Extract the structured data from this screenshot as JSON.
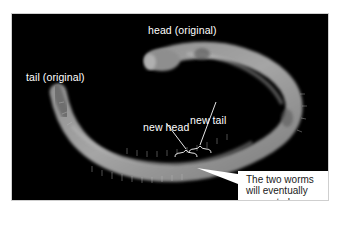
{
  "figure": {
    "labels": {
      "head_original": "head (original)",
      "tail_original": "tail (original)",
      "new_tail": "new tail",
      "new_head": "new head"
    },
    "callout": {
      "line1": "The two worms",
      "line2": "will eventually",
      "line3": "separate here"
    },
    "colors": {
      "background": "#000000",
      "label_text": "#ffffff",
      "callout_bg": "#ffffff",
      "callout_text": "#1a1a1a",
      "worm": "#9a9a9a"
    }
  }
}
